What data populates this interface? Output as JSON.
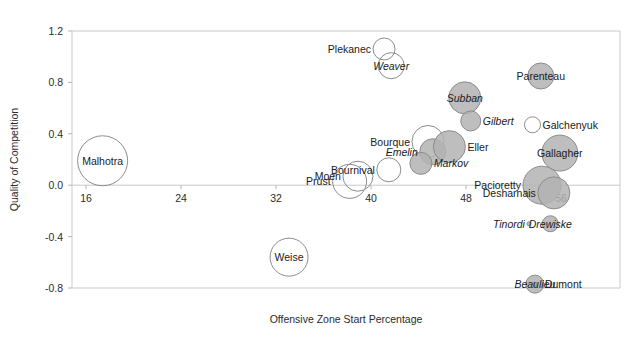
{
  "chart_data": {
    "type": "scatter",
    "title": "",
    "subtitle": "",
    "xlabel": "Offensive Zone Start Percentage",
    "ylabel": "Quality of Competition",
    "xlim": [
      14,
      61
    ],
    "ylim": [
      -0.85,
      1.25
    ],
    "xticks": [
      "16",
      "24",
      "32",
      "40",
      "48",
      "56"
    ],
    "xtickvalues": [
      16,
      24,
      32,
      40,
      48,
      56
    ],
    "yticks": [
      "1.2",
      "0.8",
      "0.4",
      "0.0",
      "-0.4",
      "-0.8"
    ],
    "ytickvalues": [
      1.2,
      0.8,
      0.4,
      0.0,
      -0.4,
      -0.8
    ],
    "grid": false,
    "legend": "none",
    "note": "Bubble chart; bubble radius encodes a third magnitude (ice time). Filled grey bubbles vs open outline bubbles.",
    "colors": {
      "bubble_fill": "#b3b3b3",
      "bubble_open": "#ffffff",
      "bubble_stroke": "#8c8c8c",
      "axis": "#c9c9c9",
      "text": "#1a1a1a"
    },
    "points": [
      {
        "name": "Malhotra",
        "x": 17.4,
        "y": 0.19,
        "r": 25,
        "filled": false,
        "italic": false,
        "label_pos": "center"
      },
      {
        "name": "Weise",
        "x": 33.1,
        "y": -0.56,
        "r": 19,
        "filled": false,
        "italic": false,
        "label_pos": "center"
      },
      {
        "name": "Prust",
        "x": 38.2,
        "y": 0.03,
        "r": 17,
        "filled": false,
        "italic": false,
        "label_pos": "left"
      },
      {
        "name": "Moen",
        "x": 38.9,
        "y": 0.07,
        "r": 15,
        "filled": false,
        "italic": false,
        "label_pos": "left"
      },
      {
        "name": "Bournival",
        "x": 41.5,
        "y": 0.12,
        "r": 12,
        "filled": false,
        "italic": false,
        "label_pos": "left"
      },
      {
        "name": "Bourque",
        "x": 44.8,
        "y": 0.34,
        "r": 16,
        "filled": false,
        "italic": false,
        "label_pos": "left"
      },
      {
        "name": "Emelin",
        "x": 45.2,
        "y": 0.26,
        "r": 13,
        "filled": true,
        "italic": true,
        "label_pos": "left"
      },
      {
        "name": "Markov",
        "x": 44.2,
        "y": 0.17,
        "r": 11,
        "filled": true,
        "italic": true,
        "label_pos": "right"
      },
      {
        "name": "Eller",
        "x": 46.6,
        "y": 0.3,
        "r": 16,
        "filled": true,
        "italic": false,
        "label_pos": "right"
      },
      {
        "name": "Plekanec",
        "x": 41.1,
        "y": 1.06,
        "r": 11,
        "filled": false,
        "italic": false,
        "label_pos": "left"
      },
      {
        "name": "Weaver",
        "x": 41.7,
        "y": 0.93,
        "r": 13,
        "filled": false,
        "italic": true,
        "label_pos": "center"
      },
      {
        "name": "Subban",
        "x": 47.9,
        "y": 0.68,
        "r": 16,
        "filled": true,
        "italic": true,
        "label_pos": "center"
      },
      {
        "name": "Gilbert",
        "x": 48.4,
        "y": 0.5,
        "r": 10,
        "filled": true,
        "italic": true,
        "label_pos": "right"
      },
      {
        "name": "Galchenyuk",
        "x": 53.6,
        "y": 0.47,
        "r": 8,
        "filled": false,
        "italic": false,
        "label_pos": "right"
      },
      {
        "name": "Parenteau",
        "x": 54.3,
        "y": 0.85,
        "r": 13,
        "filled": true,
        "italic": false,
        "label_pos": "center"
      },
      {
        "name": "Gallagher",
        "x": 55.9,
        "y": 0.25,
        "r": 18,
        "filled": true,
        "italic": false,
        "label_pos": "center"
      },
      {
        "name": "Pacioretty",
        "x": 54.4,
        "y": 0.0,
        "r": 19,
        "filled": true,
        "italic": false,
        "label_pos": "left"
      },
      {
        "name": "Desharnais",
        "x": 55.4,
        "y": -0.06,
        "r": 16,
        "filled": true,
        "italic": false,
        "label_pos": "left"
      },
      {
        "name": "Tinordi",
        "x": 53.3,
        "y": -0.3,
        "r": 2,
        "filled": true,
        "italic": true,
        "label_pos": "left"
      },
      {
        "name": "Drewiske",
        "x": 55.1,
        "y": -0.3,
        "r": 8,
        "filled": true,
        "italic": true,
        "label_pos": "center"
      },
      {
        "name": "Beaulieu",
        "x": 53.8,
        "y": -0.77,
        "r": 9,
        "filled": true,
        "italic": true,
        "label_pos": "center"
      },
      {
        "name": "Dumont",
        "x": 53.8,
        "y": -0.77,
        "r": 2,
        "filled": true,
        "italic": false,
        "label_pos": "right2"
      }
    ]
  }
}
